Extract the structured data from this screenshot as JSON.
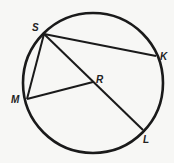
{
  "diagram": {
    "type": "circle-geometry",
    "circle": {
      "center_label": "R"
    },
    "points": [
      {
        "label": "S"
      },
      {
        "label": "K"
      },
      {
        "label": "R"
      },
      {
        "label": "M"
      },
      {
        "label": "L"
      }
    ],
    "segments": [
      "SK",
      "SM",
      "SL",
      "MR"
    ]
  }
}
